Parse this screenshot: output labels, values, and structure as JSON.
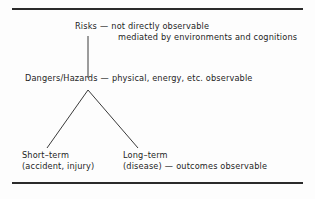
{
  "figure": {
    "background_color": "#fdfdfd",
    "ink_color": "#1d1d1d",
    "rule_color": "#2b2b2b",
    "connector_color": "#3a3a3a"
  },
  "nodes": {
    "risks": {
      "term": "Risks",
      "dash": "—",
      "description_line1": "not directly observable",
      "description_line2": "mediated by environments and cognitions"
    },
    "dangers": {
      "term": "Dangers/Hazards",
      "dash": "—",
      "description": "physical, energy, etc. observable"
    },
    "short_term": {
      "term": "Short–term",
      "detail": "(accident, injury)"
    },
    "long_term": {
      "term": "Long–term",
      "detail": "(disease)",
      "dash": "—",
      "description": "outcomes observable"
    }
  }
}
